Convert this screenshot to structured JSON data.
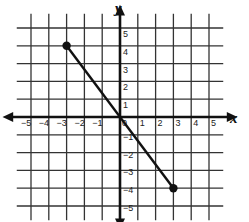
{
  "chart_data": {
    "type": "line",
    "title": "",
    "xlabel": "x",
    "ylabel": "y",
    "xlim": [
      -5,
      5
    ],
    "ylim": [
      -5,
      5
    ],
    "grid": true,
    "x_ticks": [
      "-5",
      "-4",
      "-3",
      "-2",
      "-1",
      "0",
      "1",
      "2",
      "3",
      "4",
      "5"
    ],
    "y_ticks": [
      "5",
      "4",
      "3",
      "2",
      "1",
      "-1",
      "-2",
      "-3",
      "-4",
      "-5"
    ],
    "series": [
      {
        "name": "segment",
        "points": [
          {
            "x": -3,
            "y": 4
          },
          {
            "x": 3,
            "y": -4
          }
        ],
        "endpoints": "closed-dots"
      }
    ]
  },
  "labels": {
    "x_axis": "x",
    "y_axis": "y",
    "origin": "0"
  }
}
